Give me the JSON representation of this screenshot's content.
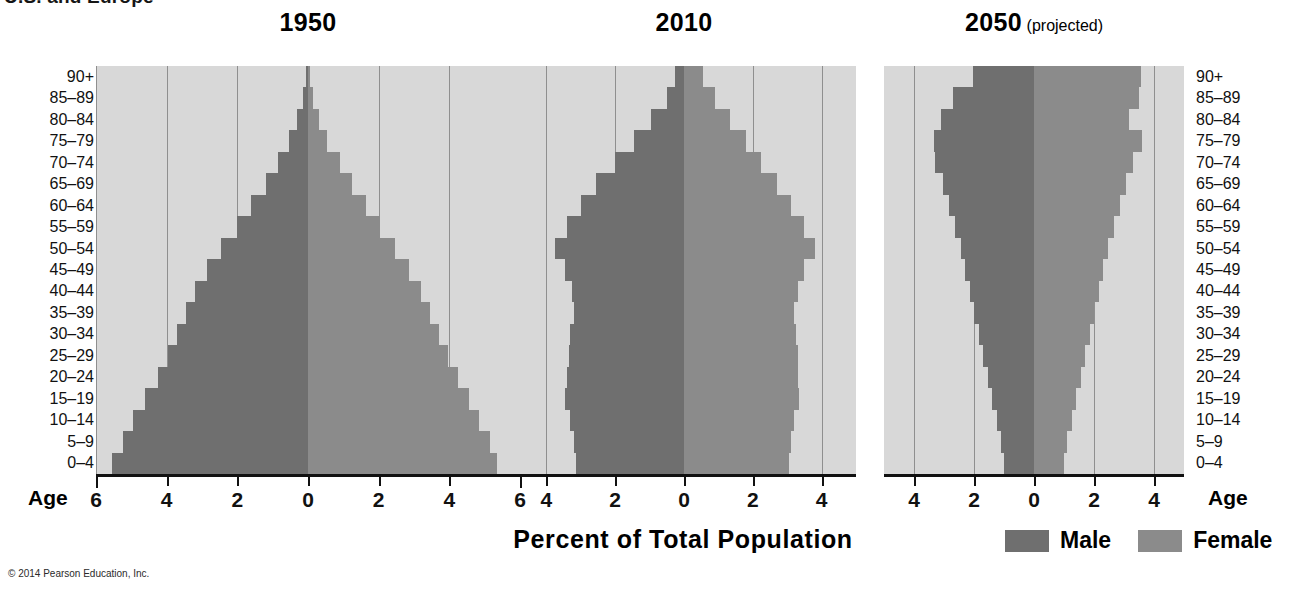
{
  "figure": {
    "clipped_header": "U.S. and Europe",
    "x_axis_label": "Percent of Total Population",
    "age_axis_label": "Age",
    "copyright": "© 2014 Pearson Education, Inc.",
    "age_groups": [
      "90+",
      "85–89",
      "80–84",
      "75–79",
      "70–74",
      "65–69",
      "60–64",
      "55–59",
      "50–54",
      "45–49",
      "40–44",
      "35–39",
      "30–34",
      "25–29",
      "20–24",
      "15–19",
      "10–14",
      "5–9",
      "0–4"
    ],
    "legend": [
      {
        "label": "Male",
        "color": "#6f6f6f"
      },
      {
        "label": "Female",
        "color": "#8b8b8b"
      }
    ],
    "colors": {
      "male": "#6f6f6f",
      "female": "#8b8b8b",
      "plot_background": "#d8d8d8",
      "gridline": "#8f8f8f",
      "axis": "#111111",
      "page_background": "#ffffff"
    }
  },
  "chart_data": [
    {
      "type": "bar",
      "orientation": "population-pyramid",
      "title": "1950",
      "subtitle": "",
      "xlabel": "Percent of Total Population",
      "ylabel": "Age",
      "xlim": [
        -6,
        6
      ],
      "xticks": [
        6,
        4,
        2,
        0,
        2,
        4,
        6
      ],
      "xtick_values": [
        -6,
        -4,
        -2,
        0,
        2,
        4,
        6
      ],
      "grid": true,
      "categories": [
        "90+",
        "85–89",
        "80–84",
        "75–79",
        "70–74",
        "65–69",
        "60–64",
        "55–59",
        "50–54",
        "45–49",
        "40–44",
        "35–39",
        "30–34",
        "25–29",
        "20–24",
        "15–19",
        "10–14",
        "5–9",
        "0–4"
      ],
      "series": [
        {
          "name": "Male",
          "side": "left",
          "values": [
            0.05,
            0.15,
            0.3,
            0.55,
            0.85,
            1.2,
            1.6,
            2.0,
            2.45,
            2.85,
            3.2,
            3.45,
            3.7,
            3.95,
            4.25,
            4.6,
            4.95,
            5.25,
            5.55
          ]
        },
        {
          "name": "Female",
          "side": "right",
          "values": [
            0.05,
            0.15,
            0.3,
            0.55,
            0.9,
            1.25,
            1.65,
            2.05,
            2.45,
            2.85,
            3.2,
            3.45,
            3.7,
            3.95,
            4.25,
            4.55,
            4.85,
            5.15,
            5.35
          ]
        }
      ]
    },
    {
      "type": "bar",
      "orientation": "population-pyramid",
      "title": "2010",
      "subtitle": "",
      "xlabel": "Percent of Total Population",
      "ylabel": "Age",
      "xlim": [
        -5,
        5
      ],
      "xticks": [
        4,
        2,
        0,
        2,
        4
      ],
      "xtick_values": [
        -4,
        -2,
        0,
        2,
        4
      ],
      "grid": true,
      "categories": [
        "90+",
        "85–89",
        "80–84",
        "75–79",
        "70–74",
        "65–69",
        "60–64",
        "55–59",
        "50–54",
        "45–49",
        "40–44",
        "35–39",
        "30–34",
        "25–29",
        "20–24",
        "15–19",
        "10–14",
        "5–9",
        "0–4"
      ],
      "series": [
        {
          "name": "Male",
          "side": "left",
          "values": [
            0.25,
            0.5,
            0.95,
            1.45,
            2.0,
            2.55,
            3.0,
            3.4,
            3.75,
            3.45,
            3.25,
            3.2,
            3.3,
            3.35,
            3.4,
            3.45,
            3.3,
            3.2,
            3.15
          ]
        },
        {
          "name": "Female",
          "side": "right",
          "values": [
            0.55,
            0.9,
            1.35,
            1.8,
            2.25,
            2.7,
            3.1,
            3.5,
            3.8,
            3.5,
            3.3,
            3.2,
            3.25,
            3.3,
            3.3,
            3.35,
            3.2,
            3.1,
            3.05
          ]
        }
      ]
    },
    {
      "type": "bar",
      "orientation": "population-pyramid",
      "title": "2050",
      "subtitle": " (projected)",
      "xlabel": "Percent of Total Population",
      "ylabel": "Age",
      "xlim": [
        -5,
        5
      ],
      "xticks": [
        4,
        2,
        0,
        2,
        4
      ],
      "xtick_values": [
        -4,
        -2,
        0,
        2,
        4
      ],
      "grid": true,
      "categories": [
        "90+",
        "85–89",
        "80–84",
        "75–79",
        "70–74",
        "65–69",
        "60–64",
        "55–59",
        "50–54",
        "45–49",
        "40–44",
        "35–39",
        "30–34",
        "25–29",
        "20–24",
        "15–19",
        "10–14",
        "5–9",
        "0–4"
      ],
      "series": [
        {
          "name": "Male",
          "side": "left",
          "values": [
            2.05,
            2.7,
            3.1,
            3.35,
            3.3,
            3.05,
            2.85,
            2.65,
            2.45,
            2.3,
            2.15,
            2.0,
            1.85,
            1.7,
            1.55,
            1.4,
            1.25,
            1.1,
            1.0
          ]
        },
        {
          "name": "Female",
          "side": "right",
          "values": [
            3.55,
            3.5,
            3.15,
            3.6,
            3.3,
            3.05,
            2.85,
            2.65,
            2.45,
            2.3,
            2.15,
            2.0,
            1.85,
            1.7,
            1.55,
            1.4,
            1.25,
            1.1,
            1.0
          ]
        }
      ]
    }
  ]
}
